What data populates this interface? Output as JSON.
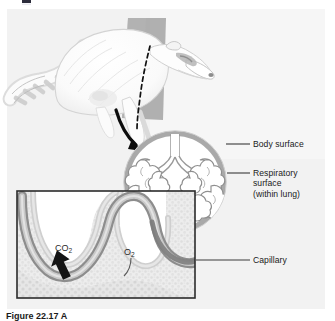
{
  "figure": {
    "domain": "Diagram",
    "title_caption": "Figure 22.17  A",
    "canvas": {
      "width": 335,
      "height": 321
    },
    "background_color": "#f2f2f2",
    "plate_color": "#efefef"
  },
  "callout_labels": [
    {
      "id": "body-surface",
      "text": "Body surface",
      "x": 253,
      "y": 139,
      "leader_from_x": 231,
      "leader_to_x": 250,
      "leader_y": 144
    },
    {
      "id": "respiratory-surface",
      "lines": [
        "Respiratory",
        "surface",
        "(within lung)"
      ],
      "x": 253,
      "y": 168,
      "leader_from_x": 231,
      "leader_to_x": 250,
      "leader_y": 173
    },
    {
      "id": "capillary",
      "text": "Capillary",
      "x": 253,
      "y": 255,
      "leader_from_x": 196,
      "leader_to_x": 250,
      "leader_y": 260
    }
  ],
  "inset_labels": [
    {
      "id": "co2",
      "text": "CO",
      "subscript": "2",
      "x": 55,
      "y": 243
    },
    {
      "id": "o2",
      "text": "O",
      "subscript": "2",
      "x": 124,
      "y": 247
    }
  ],
  "organism": {
    "name": "raccoon",
    "rendering": "line-art body in pale gray-white with banded tail",
    "fill": "#fbfbfb",
    "outline": "#c9c9c9"
  },
  "elements": {
    "gray_wedge": {
      "name": "magnification-wedge",
      "color": "#a8a8a8"
    },
    "dashed_cut_line": {
      "name": "body-cut-dashed-line",
      "color": "#111111"
    },
    "curved_arrow_to_lung": {
      "name": "zoom-arrow-to-lung",
      "color": "#0d0d0d"
    },
    "curved_arrow_to_inset": {
      "name": "zoom-arrow-to-inset",
      "color": "#0d0d0d"
    },
    "body_outline_ring": {
      "name": "body-surface-ring",
      "color": "#a9a9a9",
      "thickness_px": 5
    },
    "lung_tree": {
      "name": "bronchial-tree",
      "stroke": "#8a8a8a",
      "fill": "#ffffff"
    },
    "inset_frame": {
      "name": "inset-border",
      "color": "#2b2b2b"
    },
    "inset_tissue": {
      "name": "alveolar-tissue",
      "fill": "#eaeaea",
      "stipple": "#d2d2d2"
    },
    "capillary_band": {
      "name": "capillary-vessel",
      "outer": "#8e8e8e",
      "inner": "#d9d9d9"
    },
    "co2_arrow": {
      "name": "co2-diffusion-arrow",
      "color": "#151515"
    }
  },
  "colors": {
    "text": "#1a1a1a",
    "leader_line": "#3a3a3a",
    "gray_mid": "#a8a8a8",
    "gray_light": "#d5d5d5"
  }
}
